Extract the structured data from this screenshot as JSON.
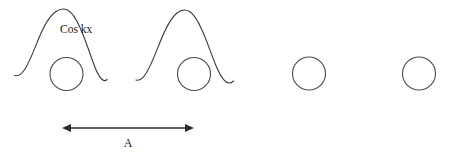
{
  "diagram": {
    "background_color": "#ffffff",
    "stroke_color": "#3a3a3a",
    "text_color": "#1a1a1a",
    "labels": {
      "wave_label": "Cos kx",
      "period_label": "A"
    },
    "circles": [
      {
        "name": "circle-1",
        "cx": 66.5,
        "cy": 74,
        "r": 16.5
      },
      {
        "name": "circle-2",
        "cx": 194,
        "cy": 74,
        "r": 16.5
      },
      {
        "name": "circle-3",
        "cx": 309,
        "cy": 73.5,
        "r": 16.5
      },
      {
        "name": "circle-4",
        "cx": 419,
        "cy": 73.5,
        "r": 16.5
      }
    ],
    "curves": [
      {
        "name": "cosine-hump-1",
        "peak_x": 66,
        "peak_y": 9,
        "left_x": 14,
        "right_x": 107,
        "baseline_y": 80
      },
      {
        "name": "cosine-hump-2",
        "peak_x": 186,
        "peak_y": 10,
        "left_x": 136,
        "right_x": 234,
        "baseline_y": 82
      }
    ],
    "period_arrow": {
      "name": "period-arrow",
      "x_start": 62,
      "x_end": 194,
      "y": 128,
      "double_headed": true,
      "label_x": 128,
      "label_y": 147
    },
    "cos_label_position": {
      "x": 60,
      "y": 33
    }
  }
}
